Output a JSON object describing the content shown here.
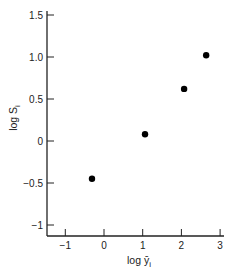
{
  "chart_data": {
    "type": "scatter",
    "title": "",
    "xlabel": "log ȳ",
    "xlabel_sub": "i",
    "ylabel": "log S",
    "ylabel_sub": "i",
    "xlim": [
      -1.5,
      3.1
    ],
    "ylim": [
      -1.12,
      1.55
    ],
    "xticks": [
      -1,
      0,
      1,
      2,
      3
    ],
    "xtick_labels": [
      "−1",
      "0",
      "1",
      "2",
      "3"
    ],
    "yticks": [
      1.5,
      1.0,
      0.5,
      0,
      -0.5,
      -1
    ],
    "ytick_labels": [
      "1.5",
      "1.0",
      "0.5",
      "0",
      "−0.5",
      "−1"
    ],
    "grid": false,
    "legend": null,
    "series": [
      {
        "name": "data",
        "marker": "filled-circle",
        "color": "#000000",
        "points": [
          {
            "x": -0.31,
            "y": -0.45
          },
          {
            "x": 1.06,
            "y": 0.08
          },
          {
            "x": 2.07,
            "y": 0.62
          },
          {
            "x": 2.64,
            "y": 1.02
          }
        ]
      }
    ]
  },
  "layout": {
    "axis_color": "#222222",
    "marker_color": "#000000"
  }
}
